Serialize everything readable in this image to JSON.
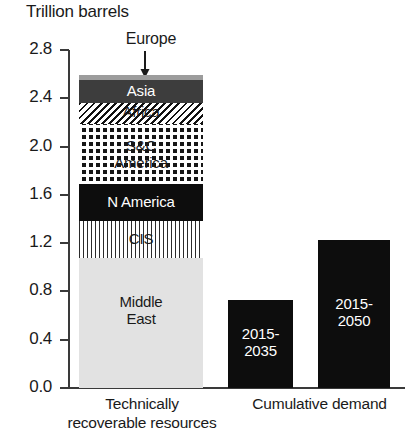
{
  "chart": {
    "title": "Trillion barrels",
    "y_axis": {
      "ticks": [
        "2.8",
        "2.4",
        "2.0",
        "1.6",
        "1.2",
        "0.8",
        "0.4",
        "0.0"
      ],
      "min": 0.0,
      "max": 2.8,
      "step": 0.4
    },
    "annotation": {
      "europe_label": "Europe",
      "europe_arrow_icon": "down-arrow-icon"
    },
    "categories": [
      {
        "id": "technically-recoverable-resources",
        "caption_line1": "Technically",
        "caption_line2": "recoverable resources"
      },
      {
        "id": "cumulative-demand",
        "caption_line1": "Cumulative demand",
        "caption_line2": ""
      }
    ],
    "stacked_segments": [
      {
        "label": "Europe",
        "value": 0.04,
        "pattern": "solid-gray",
        "color": "#9c9c9c",
        "text_color": "#1a1a1a",
        "show_label": false
      },
      {
        "label": "Asia",
        "value": 0.19,
        "pattern": "solid-dark-gray",
        "color": "#3d3d3d",
        "text_color": "#ffffff",
        "show_label": true
      },
      {
        "label": "Africa",
        "value": 0.17,
        "pattern": "diagonal-hatch",
        "color": "#111111",
        "text_color": "#1a1a1a",
        "show_label": true
      },
      {
        "label": "S&C America",
        "value": 0.5,
        "pattern": "checkerboard",
        "color": "#161616",
        "text_color": "#1a1a1a",
        "show_label": true
      },
      {
        "label": "N America",
        "value": 0.31,
        "pattern": "solid-black",
        "color": "#0d0d0d",
        "text_color": "#ffffff",
        "show_label": true
      },
      {
        "label": "CIS",
        "value": 0.3,
        "pattern": "vertical-stripes",
        "color": "#2b2b2b",
        "text_color": "#1a1a1a",
        "show_label": true
      },
      {
        "label": "Middle East",
        "value": 1.08,
        "pattern": "solid-light-gray",
        "color": "#e2e2e2",
        "text_color": "#1a1a1a",
        "show_label": true
      }
    ],
    "demand_bars": [
      {
        "label_line1": "2015-",
        "label_line2": "2035",
        "value": 0.73,
        "color": "#0d0d0d"
      },
      {
        "label_line1": "2015-",
        "label_line2": "2050",
        "value": 1.23,
        "color": "#0d0d0d"
      }
    ]
  },
  "chart_data": {
    "type": "bar",
    "title": "Trillion barrels",
    "xlabel": "",
    "ylabel": "Trillion barrels",
    "ylim": [
      0.0,
      2.8
    ],
    "ytick_step": 0.4,
    "yticks": [
      0.0,
      0.4,
      0.8,
      1.2,
      1.6,
      2.0,
      2.4,
      2.8
    ],
    "grid": false,
    "legend": "none (in-bar labels)",
    "annotations": [
      {
        "text": "Europe",
        "points_to": "Europe segment (top of stacked bar)",
        "style": "down-arrow"
      }
    ],
    "categories": [
      "Technically recoverable resources",
      "Cumulative demand 2015-2035",
      "Cumulative demand 2015-2050"
    ],
    "stacked_bar": {
      "category": "Technically recoverable resources",
      "total": 2.59,
      "segments_bottom_to_top": [
        {
          "name": "Middle East",
          "value": 1.08
        },
        {
          "name": "CIS",
          "value": 0.3
        },
        {
          "name": "N America",
          "value": 0.31
        },
        {
          "name": "S&C America",
          "value": 0.5
        },
        {
          "name": "Africa",
          "value": 0.17
        },
        {
          "name": "Asia",
          "value": 0.19
        },
        {
          "name": "Europe",
          "value": 0.04
        }
      ]
    },
    "simple_bars": [
      {
        "name": "2015-2035",
        "value": 0.73
      },
      {
        "name": "2015-2050",
        "value": 1.23
      }
    ],
    "values": [
      2.59,
      0.73,
      1.23
    ]
  }
}
